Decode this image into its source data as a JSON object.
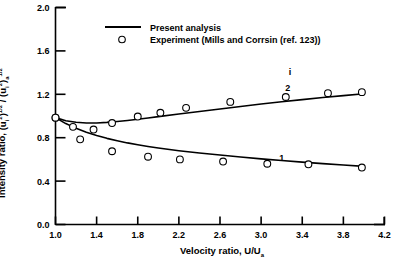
{
  "chart_data": {
    "type": "scatter",
    "title": "",
    "xlabel": "Velocity ratio, U/U",
    "xlabel_sub": "a",
    "ylabel_prefix": "Intensity ratio, ",
    "ylabel_plain": "Intensity ratio, (u_i^2)^1/2 / (u_i^2)_a^1/2",
    "xlim": [
      1.0,
      4.2
    ],
    "ylim": [
      0.0,
      2.0
    ],
    "xticks": [
      "1.0",
      "1.4",
      "1.8",
      "2.2",
      "2.6",
      "3.0",
      "3.4",
      "3.8",
      "4.2"
    ],
    "xtick_values": [
      1.0,
      1.4,
      1.8,
      2.2,
      2.6,
      3.0,
      3.4,
      3.8,
      4.2
    ],
    "yticks": [
      "0.0",
      "0.4",
      "0.8",
      "1.2",
      "1.6",
      "2.0"
    ],
    "ytick_values": [
      0.0,
      0.4,
      0.8,
      1.2,
      1.6,
      2.0
    ],
    "grid": false,
    "legend_position": "top-center",
    "legend": [
      {
        "marker": "line",
        "label": "Present analysis"
      },
      {
        "marker": "circle",
        "label": "Experiment (Mills and Corrsin (ref. 123))"
      }
    ],
    "annotations": [
      {
        "text": "i",
        "x": 3.28,
        "y": 1.38
      },
      {
        "text": "2",
        "x": 3.26,
        "y": 1.235
      },
      {
        "text": "1",
        "x": 3.2,
        "y": 0.585
      }
    ],
    "series": [
      {
        "name": "2",
        "kind": "line",
        "label": "Present analysis (curve 2)",
        "x": [
          1.0,
          1.1,
          1.2,
          1.3,
          1.4,
          1.5,
          1.6,
          1.7,
          1.8,
          1.9,
          2.0,
          2.2,
          2.4,
          2.6,
          2.8,
          3.0,
          3.2,
          3.4,
          3.6,
          3.8,
          4.0
        ],
        "y": [
          0.985,
          0.957,
          0.942,
          0.936,
          0.936,
          0.941,
          0.949,
          0.959,
          0.97,
          0.982,
          0.994,
          1.018,
          1.042,
          1.065,
          1.088,
          1.11,
          1.131,
          1.151,
          1.17,
          1.188,
          1.205
        ]
      },
      {
        "name": "1",
        "kind": "line",
        "label": "Present analysis (curve 1)",
        "x": [
          1.0,
          1.1,
          1.2,
          1.3,
          1.4,
          1.5,
          1.6,
          1.7,
          1.8,
          1.9,
          2.0,
          2.2,
          2.4,
          2.6,
          2.8,
          3.0,
          3.2,
          3.4,
          3.6,
          3.8,
          4.0
        ],
        "y": [
          0.985,
          0.93,
          0.886,
          0.85,
          0.82,
          0.794,
          0.772,
          0.752,
          0.735,
          0.719,
          0.705,
          0.68,
          0.659,
          0.64,
          0.622,
          0.605,
          0.59,
          0.575,
          0.561,
          0.548,
          0.536
        ]
      },
      {
        "name": "2-experiment",
        "kind": "scatter",
        "label": "Experiment (upper branch)",
        "x": [
          1.0,
          1.17,
          1.37,
          1.55,
          1.8,
          2.02,
          2.27,
          2.7,
          3.24,
          3.65,
          3.98
        ],
        "y": [
          0.985,
          0.9,
          0.875,
          0.935,
          0.995,
          1.03,
          1.075,
          1.13,
          1.175,
          1.21,
          1.22
        ]
      },
      {
        "name": "1-experiment",
        "kind": "scatter",
        "label": "Experiment (lower branch)",
        "x": [
          1.0,
          1.24,
          1.55,
          1.9,
          2.21,
          2.63,
          3.06,
          3.46,
          3.98
        ],
        "y": [
          0.985,
          0.785,
          0.675,
          0.625,
          0.6,
          0.58,
          0.56,
          0.555,
          0.525
        ]
      }
    ]
  },
  "style": {
    "line_color": "#000000",
    "marker_edge_color": "#000000",
    "marker_face_color": "#ffffff",
    "axis_color": "#000000",
    "background": "#ffffff"
  }
}
